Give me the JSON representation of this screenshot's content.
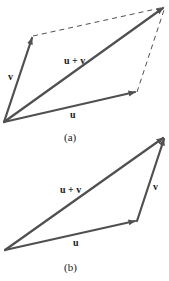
{
  "figure_a": {
    "caption": "(a)",
    "labels": {
      "u": "u",
      "v": "v",
      "sum": "u + v"
    },
    "points": {
      "origin": [
        4,
        122
      ],
      "u_tip": [
        137,
        92
      ],
      "v_tip": [
        33,
        36
      ],
      "sum_tip": [
        165,
        7
      ]
    }
  },
  "figure_b": {
    "caption": "(b)",
    "labels": {
      "u": "u",
      "v": "v",
      "sum": "u + v"
    },
    "points": {
      "origin": [
        5,
        250
      ],
      "u_tip": [
        137,
        221
      ],
      "sum_tip": [
        165,
        137
      ]
    }
  },
  "colors": {
    "vector": "#505050",
    "text": "#1a1a1a",
    "background": "#ffffff"
  }
}
